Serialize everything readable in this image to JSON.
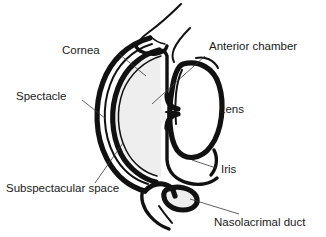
{
  "figure": {
    "background_color": "#ffffff",
    "ink_color": "#111111",
    "leader_color": "#3a3a3a",
    "shade_color": "#eeeeee",
    "width": 326,
    "height": 237
  },
  "labels": [
    {
      "id": "cornea",
      "text": "Cornea"
    },
    {
      "id": "spectacle",
      "text": "Spectacle"
    },
    {
      "id": "subspectacular-space",
      "text": "Subspectacular space"
    },
    {
      "id": "anterior-chamber",
      "text": "Anterior chamber"
    },
    {
      "id": "lens",
      "text": "Lens"
    },
    {
      "id": "iris",
      "text": "Iris"
    },
    {
      "id": "nasolacrimal-duct",
      "text": "Nasolacrimal duct"
    }
  ]
}
